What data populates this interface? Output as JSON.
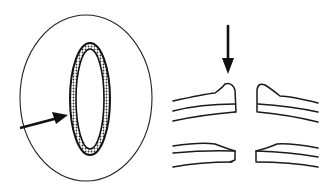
{
  "figure": {
    "left_panel": {
      "description": "Top view: outer oval with inner stippled ring, arrow pointing at ring",
      "outer_oval": {
        "cx": 86,
        "cy": 98,
        "rx": 66,
        "ry": 83
      },
      "inner_ring": {
        "cx": 90,
        "cy": 99,
        "rx": 20,
        "ry": 56
      },
      "arrow": {
        "from": [
          20,
          128
        ],
        "to": [
          66,
          116
        ]
      }
    },
    "right_panel": {
      "description": "Cross-section: upper layers with raised rim near gap, lower layers tapered; arrow pointing down at rim",
      "arrow": {
        "from": [
          228,
          26
        ],
        "to": [
          228,
          74
        ]
      }
    },
    "colors": {
      "stroke": "#1a1a1a",
      "background": "#ffffff"
    }
  }
}
